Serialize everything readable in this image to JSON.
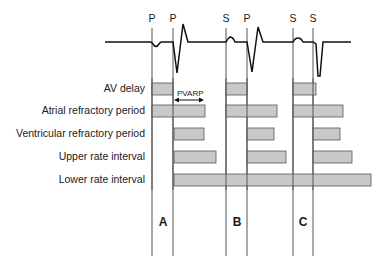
{
  "events": [
    {
      "label": "P",
      "x": 152
    },
    {
      "label": "P",
      "x": 173
    },
    {
      "label": "S",
      "x": 226
    },
    {
      "label": "P",
      "x": 247
    },
    {
      "label": "S",
      "x": 293
    },
    {
      "label": "S",
      "x": 313
    }
  ],
  "rows": [
    {
      "label": "AV delay",
      "y": 83,
      "h": 12,
      "bars": [
        [
          152,
          173
        ],
        [
          226,
          247
        ],
        [
          293,
          316
        ]
      ]
    },
    {
      "label": "Atrial refractory period",
      "y": 105,
      "h": 12,
      "bars": [
        [
          152,
          205
        ],
        [
          226,
          277
        ],
        [
          293,
          343
        ]
      ]
    },
    {
      "label": "Ventricular refractory period",
      "y": 128,
      "h": 12,
      "bars": [
        [
          174,
          204
        ],
        [
          247,
          274
        ],
        [
          313,
          340
        ]
      ]
    },
    {
      "label": "Upper rate interval",
      "y": 151,
      "h": 12,
      "bars": [
        [
          174,
          216
        ],
        [
          247,
          286
        ],
        [
          313,
          352
        ]
      ]
    },
    {
      "label": "Lower rate interval",
      "y": 174,
      "h": 12,
      "bars": [
        [
          174,
          371
        ]
      ]
    }
  ],
  "annotation": {
    "label": "PVARP",
    "x1": 174,
    "x2": 204,
    "y": 100
  },
  "sections": [
    {
      "label": "A",
      "x": 163
    },
    {
      "label": "B",
      "x": 237
    },
    {
      "label": "C",
      "x": 303
    }
  ],
  "colors": {
    "bar_fill": "#c8c8c8",
    "bar_stroke": "#555555",
    "line": "#555555",
    "ecg": "#111111"
  }
}
